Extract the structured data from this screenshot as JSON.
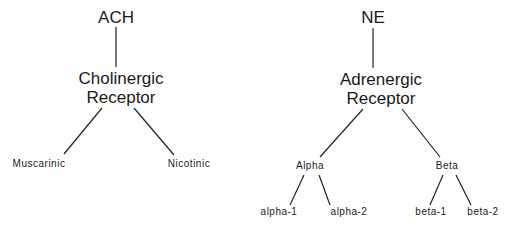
{
  "diagram": {
    "left_tree": {
      "root": "ACH",
      "receptor_line1": "Cholinergic",
      "receptor_line2": "Receptor",
      "children": [
        "Muscarinic",
        "Nicotinic"
      ]
    },
    "right_tree": {
      "root": "NE",
      "receptor_line1": "Adrenergic",
      "receptor_line2": "Receptor",
      "children": [
        {
          "label": "Alpha",
          "subtypes": [
            "alpha-1",
            "alpha-2"
          ]
        },
        {
          "label": "Beta",
          "subtypes": [
            "beta-1",
            "beta-2"
          ]
        }
      ]
    },
    "colors": {
      "line": "#222222",
      "text": "#1a1a1a",
      "background": "#ffffff"
    }
  }
}
